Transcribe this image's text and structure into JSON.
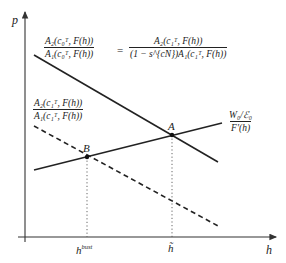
{
  "diagram": {
    "axes": {
      "y_label": "p",
      "x_label": "h"
    },
    "x_ticks": [
      {
        "label_main": "h",
        "label_sup": "bust",
        "x": 87
      },
      {
        "label_main": "h̃",
        "label_sup": "",
        "x": 172
      }
    ],
    "points": [
      {
        "name": "A",
        "x": 172,
        "y": 135
      },
      {
        "name": "B",
        "x": 87,
        "y": 157
      }
    ],
    "curves": {
      "upper_decreasing": {
        "style": "solid",
        "label_left_num": "A₂(c₀ᵀ, F(h))",
        "label_left_den": "A₁(c₀ᵀ, F(h))",
        "equals": "=",
        "label_right_num": "A₂(c₁ᵀ, F(h))",
        "label_right_den": "(1 − s^{cN})A₁(c₁ᵀ, F(h))"
      },
      "lower_decreasing": {
        "style": "dashed",
        "label_num": "A₂(c₁ᵀ, F(h))",
        "label_den": "A₁(c₁ᵀ, F(h))"
      },
      "increasing": {
        "style": "solid",
        "label_num": "W₀/ℰ₀",
        "label_den": "F′(h)"
      }
    },
    "colors": {
      "line": "#222222",
      "axis": "#333333",
      "guide": "#555555"
    }
  }
}
